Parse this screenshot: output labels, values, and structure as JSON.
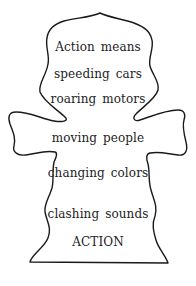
{
  "poem": {
    "lines": [
      "Action means",
      "speeding cars",
      "roaring motors",
      "moving people",
      "changing colors",
      "clashing sounds",
      "ACTION"
    ]
  },
  "colors": {
    "outline": "#1a1a1a",
    "text": "#222222",
    "background": "#ffffff"
  }
}
